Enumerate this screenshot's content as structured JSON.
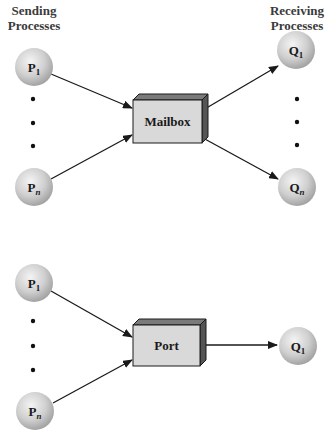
{
  "headers": {
    "sending": [
      "Sending",
      "Processes"
    ],
    "receiving": [
      "Receiving",
      "Processes"
    ]
  },
  "colors": {
    "arrow": "#1a1a1a",
    "box_front": "#d9d9d9",
    "box_top": "#7a7a7a",
    "box_side": "#555555",
    "node_light": "#f2f2f2",
    "node_dark": "#a8a8a8",
    "text": "#1a1a1a"
  },
  "mailbox_section": {
    "box_label": "Mailbox",
    "senders": [
      {
        "label": "P",
        "sub": "1"
      },
      {
        "label": "P",
        "sub": "n"
      }
    ],
    "receivers": [
      {
        "label": "Q",
        "sub": "1"
      },
      {
        "label": "Q",
        "sub": "n"
      }
    ]
  },
  "port_section": {
    "box_label": "Port",
    "senders": [
      {
        "label": "P",
        "sub": "1"
      },
      {
        "label": "P",
        "sub": "n"
      }
    ],
    "receivers": [
      {
        "label": "Q",
        "sub": "1"
      }
    ]
  }
}
